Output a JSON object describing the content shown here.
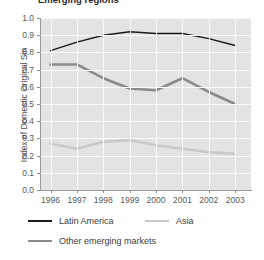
{
  "chart_data": {
    "type": "line",
    "title": "Emerging regions",
    "xlabel": "",
    "ylabel": "Index of Domestic Original Sin",
    "categories": [
      "1996",
      "1997",
      "1998",
      "1999",
      "2000",
      "2001",
      "2002",
      "2003"
    ],
    "x": [
      1996,
      1997,
      1998,
      1999,
      2000,
      2001,
      2002,
      2003
    ],
    "xlim": [
      1995.6,
      2003.6
    ],
    "ylim": [
      0.0,
      1.0
    ],
    "y_ticks": [
      "0.0",
      "0.1",
      "0.2",
      "0.3",
      "0.4",
      "0.5",
      "0.6",
      "0.7",
      "0.8",
      "0.9",
      "1.0"
    ],
    "y_tick_values": [
      0.0,
      0.1,
      0.2,
      0.3,
      0.4,
      0.5,
      0.6,
      0.7,
      0.8,
      0.9,
      1.0
    ],
    "grid": true,
    "grid_color": "#fafafa",
    "plot_background": "#e3e3e3",
    "legend_position": "bottom-left",
    "series": [
      {
        "name": "Latin America",
        "color": "#1a1a1a",
        "values": [
          0.81,
          0.86,
          0.9,
          0.92,
          0.91,
          0.91,
          0.88,
          0.84
        ]
      },
      {
        "name": "Asia",
        "color": "#c9c9c9",
        "values": [
          0.27,
          0.24,
          0.28,
          0.29,
          0.26,
          0.24,
          0.22,
          0.21
        ]
      },
      {
        "name": "Other emerging markets",
        "color": "#8a8a8a",
        "values": [
          0.73,
          0.73,
          0.65,
          0.59,
          0.58,
          0.65,
          0.57,
          0.5
        ]
      }
    ]
  },
  "legend": {
    "entries": [
      {
        "label": "Latin America",
        "color": "#1a1a1a"
      },
      {
        "label": "Asia",
        "color": "#c9c9c9"
      },
      {
        "label": "Other emerging markets",
        "color": "#8a8a8a"
      }
    ]
  }
}
